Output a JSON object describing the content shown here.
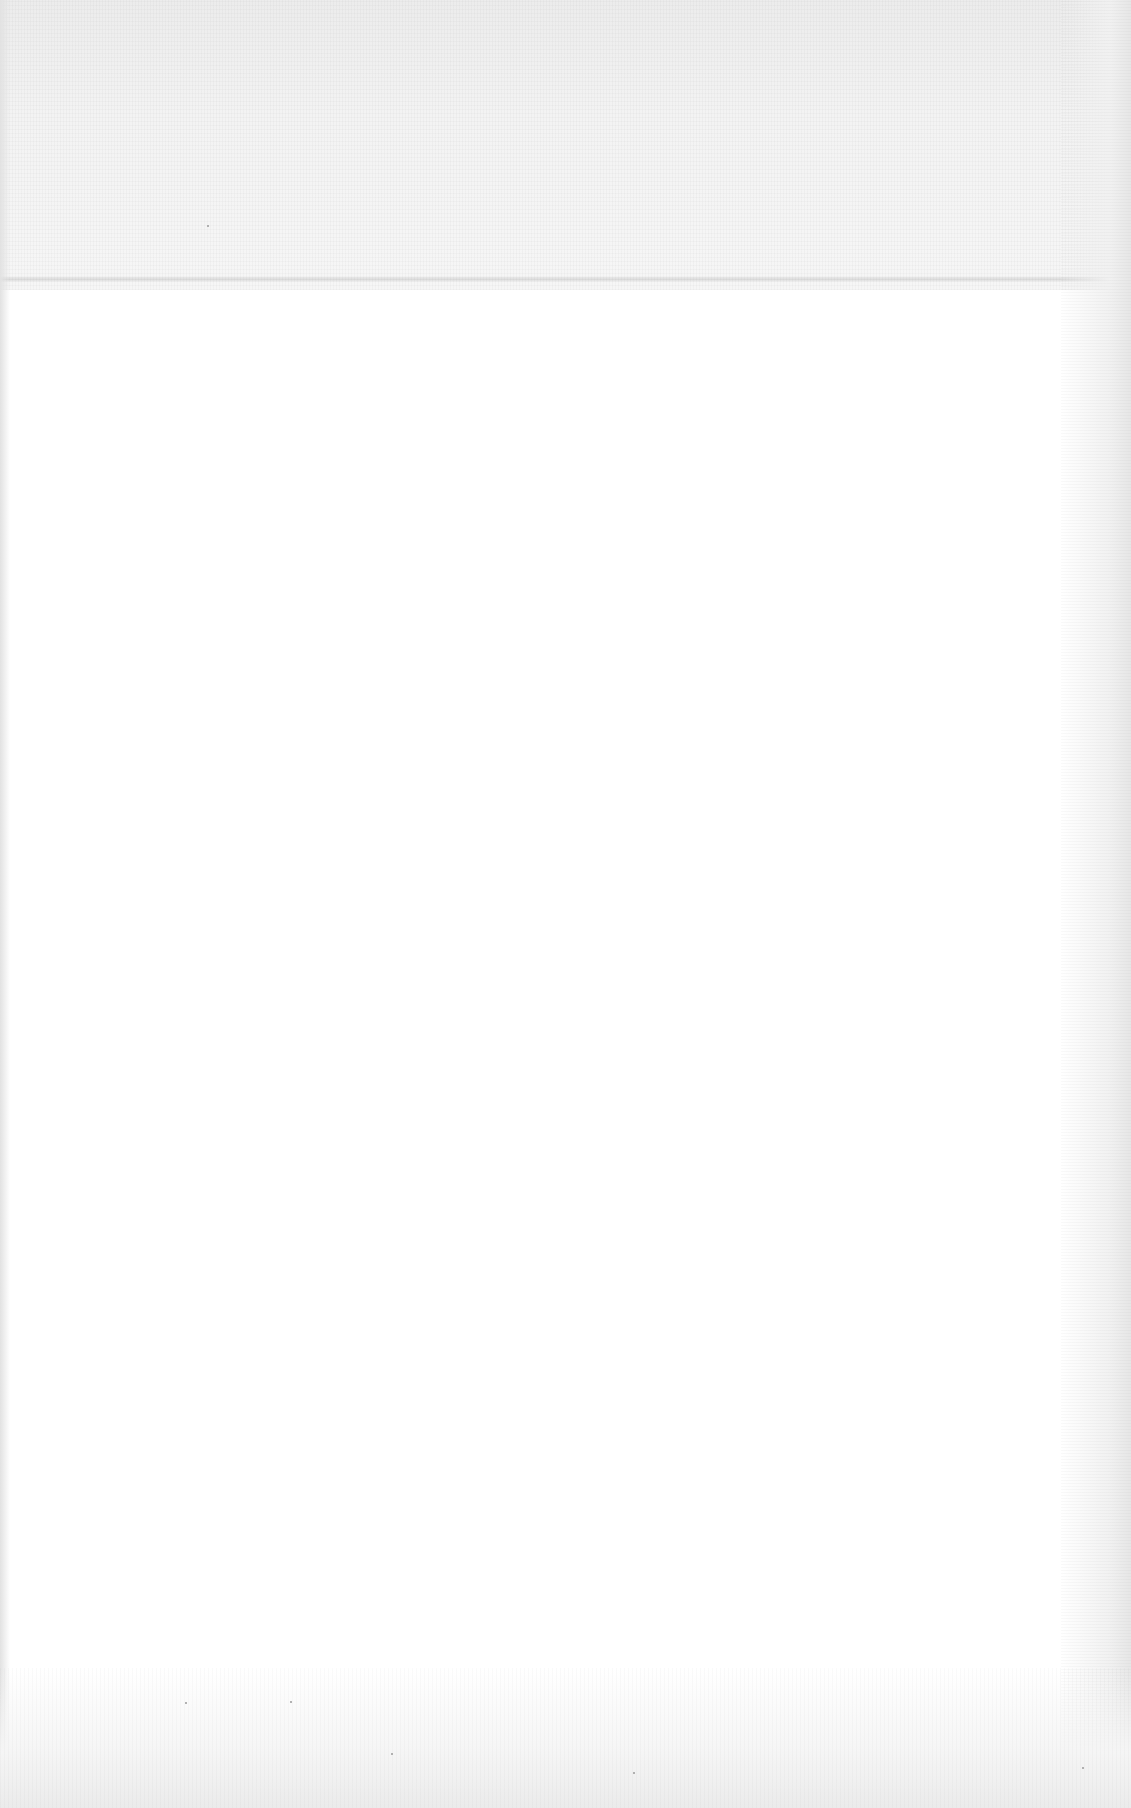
{
  "document": {
    "type": "scanned blank page",
    "text": "",
    "colors": {
      "paper": "#ffffff",
      "scan_noise": "#ececec",
      "fold_line": "#d8d8d8"
    }
  }
}
